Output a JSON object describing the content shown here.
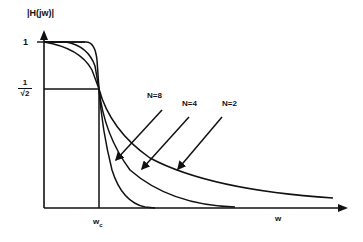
{
  "figure": {
    "type": "butterworth-lowpass-magnitude-response",
    "y_axis_label": "|H(jw)|",
    "x_axis_label": "w",
    "cutoff_label": "w",
    "cutoff_subscript": "c",
    "y_ticks": {
      "one": "1",
      "half_power_numerator": "1",
      "half_power_denominator": "√2"
    },
    "curves": [
      {
        "label": "N=8",
        "order": 8
      },
      {
        "label": "N=4",
        "order": 4
      },
      {
        "label": "N=2",
        "order": 2
      }
    ],
    "ideal_response": "rectangular brick-wall up to w_c",
    "line_color": "#111111",
    "background": "#ffffff"
  }
}
